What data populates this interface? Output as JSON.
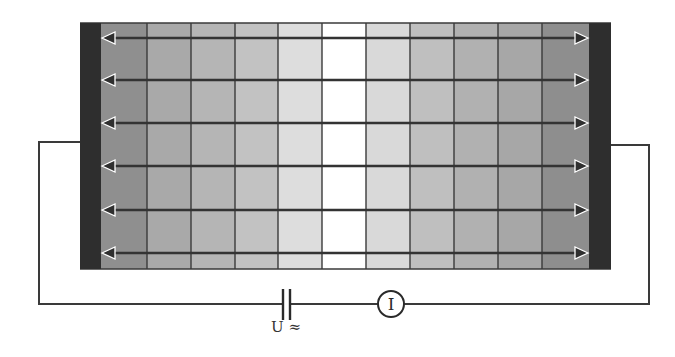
{
  "diagram": {
    "type": "electrophoresis-cell-circuit",
    "cell": {
      "x": 80,
      "y": 23,
      "width": 531,
      "height": 246,
      "left_electrode": {
        "x": 80,
        "width": 21,
        "color": "#2e2e2e"
      },
      "right_electrode": {
        "x": 589,
        "width": 22,
        "color": "#2e2e2e"
      },
      "column_edges": [
        101,
        147,
        191,
        235,
        278,
        322,
        366,
        410,
        454,
        498,
        542,
        589
      ],
      "column_colors": [
        "#8f8f8f",
        "#a9a9a9",
        "#b5b5b5",
        "#c2c2c2",
        "#dddddd",
        "#ffffff",
        "#d9d9d9",
        "#bfbfbf",
        "#b1b1b1",
        "#a7a7a7",
        "#8e8e8e"
      ],
      "top_line_y": 23,
      "bottom_line_y": 269,
      "grid_color": "#3a3a3a"
    },
    "field_arrows": {
      "y_positions": [
        38,
        80,
        123,
        166,
        210,
        253
      ],
      "x_start": 102,
      "x_end": 588,
      "direction": "bidirectional",
      "color": "#333333"
    },
    "circuit": {
      "wire_color": "#3a3a3a",
      "left_wire": {
        "attach_y": 142,
        "x": 39
      },
      "right_wire": {
        "attach_y": 145,
        "x": 649
      },
      "bottom_y": 304,
      "capacitor": {
        "x1": 283,
        "x2": 290,
        "y_top": 289,
        "y_bottom": 320
      },
      "ammeter": {
        "cx": 391,
        "cy": 304,
        "r": 13,
        "symbol": "I"
      }
    },
    "labels": {
      "voltage_source": "U ≈",
      "ammeter": "I"
    }
  }
}
